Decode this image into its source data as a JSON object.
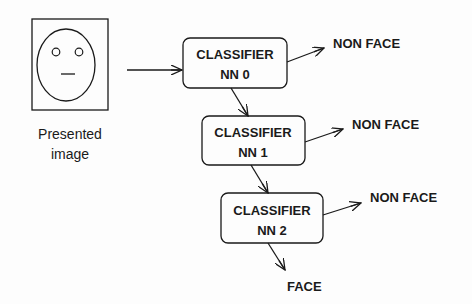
{
  "input": {
    "caption_line1": "Presented",
    "caption_line2": "image",
    "icon": "face-sketch-icon"
  },
  "classifiers": [
    {
      "line1": "CLASSIFIER",
      "line2": "NN 0",
      "reject_label": "NON FACE"
    },
    {
      "line1": "CLASSIFIER",
      "line2": "NN 1",
      "reject_label": "NON FACE"
    },
    {
      "line1": "CLASSIFIER",
      "line2": "NN 2",
      "reject_label": "NON FACE"
    }
  ],
  "accept_label": "FACE",
  "colors": {
    "stroke": "#1a1a1a",
    "background": "#fdfdfd"
  }
}
